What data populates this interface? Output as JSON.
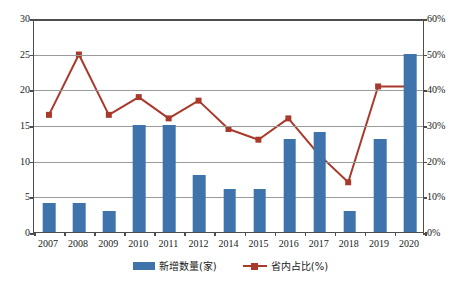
{
  "chart_data": {
    "type": "bar",
    "title": "",
    "subtitle": "",
    "xlabel": "",
    "ylabel": "",
    "y2label": "",
    "grid": true,
    "legend_position": "bottom",
    "categories": [
      "2007",
      "2008",
      "2009",
      "2010",
      "2011",
      "2012",
      "2014",
      "2015",
      "2016",
      "2017",
      "2018",
      "2019",
      "2020"
    ],
    "y_left": {
      "min": 0,
      "max": 30,
      "step": 5,
      "ticks": [
        "0",
        "5",
        "10",
        "15",
        "20",
        "25",
        "30"
      ]
    },
    "y_right": {
      "min": 0,
      "max": 60,
      "step": 10,
      "ticks": [
        "0%",
        "10%",
        "20%",
        "30%",
        "40%",
        "50%",
        "60%"
      ]
    },
    "series": [
      {
        "name": "新增数量(家)",
        "type": "bar",
        "axis": "left",
        "color": "#3e73ac",
        "values": [
          4,
          4,
          3,
          15,
          15,
          8,
          6,
          6,
          13,
          14,
          3,
          13,
          25
        ]
      },
      {
        "name": "省内占比(%)",
        "type": "line",
        "axis": "right",
        "color": "#a8392b",
        "values": [
          33,
          50,
          33,
          38,
          32,
          37,
          29,
          26,
          32,
          22,
          14,
          41,
          41
        ]
      }
    ]
  },
  "legend": {
    "items": [
      {
        "label": "新增数量(家)",
        "marker": "bar-swatch",
        "color": "#3e73ac"
      },
      {
        "label": "省内占比(%)",
        "marker": "line-swatch",
        "color": "#a8392b"
      }
    ]
  }
}
